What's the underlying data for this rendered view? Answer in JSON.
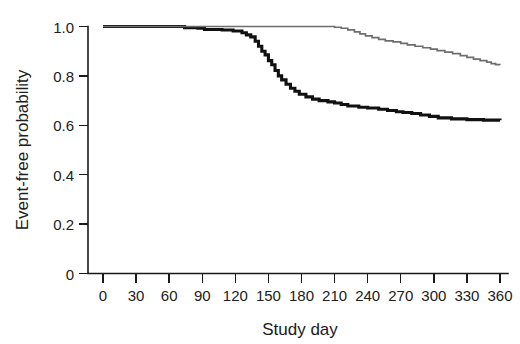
{
  "figure": {
    "background_color": "#ffffff",
    "width": 520,
    "height": 344
  },
  "axes": {
    "x_title": "Study day",
    "y_title": "Event-free probability",
    "x_ticks": [
      "0",
      "30",
      "60",
      "90",
      "120",
      "150",
      "180",
      "210",
      "240",
      "270",
      "300",
      "330",
      "360"
    ],
    "y_ticks": [
      "0",
      "0.2",
      "0.4",
      "0.6",
      "0.8",
      "1.0"
    ]
  },
  "chart_data": {
    "type": "line",
    "title": "",
    "subtitle": "",
    "xlabel": "Study day",
    "ylabel": "Event-free probability",
    "xlim": [
      0,
      360
    ],
    "ylim": [
      0,
      1.0
    ],
    "x_ticks": [
      0,
      30,
      60,
      90,
      120,
      150,
      180,
      210,
      240,
      270,
      300,
      330,
      360
    ],
    "y_ticks": [
      0,
      0.2,
      0.4,
      0.6,
      0.8,
      1.0
    ],
    "grid": false,
    "legend": "none",
    "step_style": "post",
    "annotations": [],
    "series": [
      {
        "name": "black-curve",
        "color": "#111111",
        "line_width": 3.1,
        "final_value": 0.62,
        "points": [
          [
            0,
            1.0
          ],
          [
            70,
            1.0
          ],
          [
            74,
            0.995
          ],
          [
            86,
            0.993
          ],
          [
            92,
            0.988
          ],
          [
            108,
            0.986
          ],
          [
            118,
            0.982
          ],
          [
            126,
            0.975
          ],
          [
            130,
            0.966
          ],
          [
            134,
            0.958
          ],
          [
            138,
            0.94
          ],
          [
            141,
            0.92
          ],
          [
            144,
            0.9
          ],
          [
            147,
            0.885
          ],
          [
            150,
            0.862
          ],
          [
            153,
            0.845
          ],
          [
            156,
            0.822
          ],
          [
            159,
            0.8
          ],
          [
            162,
            0.784
          ],
          [
            166,
            0.766
          ],
          [
            170,
            0.75
          ],
          [
            174,
            0.738
          ],
          [
            178,
            0.726
          ],
          [
            184,
            0.715
          ],
          [
            190,
            0.706
          ],
          [
            196,
            0.7
          ],
          [
            204,
            0.695
          ],
          [
            210,
            0.69
          ],
          [
            216,
            0.684
          ],
          [
            222,
            0.678
          ],
          [
            232,
            0.673
          ],
          [
            240,
            0.67
          ],
          [
            250,
            0.665
          ],
          [
            258,
            0.66
          ],
          [
            266,
            0.655
          ],
          [
            272,
            0.652
          ],
          [
            280,
            0.648
          ],
          [
            288,
            0.642
          ],
          [
            296,
            0.636
          ],
          [
            304,
            0.63
          ],
          [
            316,
            0.626
          ],
          [
            330,
            0.623
          ],
          [
            345,
            0.621
          ],
          [
            360,
            0.62
          ]
        ]
      },
      {
        "name": "gray-curve",
        "color": "#6e6e6e",
        "line_width": 1.7,
        "final_value": 0.845,
        "points": [
          [
            0,
            1.0
          ],
          [
            205,
            1.0
          ],
          [
            210,
            0.997
          ],
          [
            216,
            0.993
          ],
          [
            222,
            0.986
          ],
          [
            228,
            0.978
          ],
          [
            233,
            0.97
          ],
          [
            238,
            0.962
          ],
          [
            244,
            0.955
          ],
          [
            250,
            0.948
          ],
          [
            256,
            0.942
          ],
          [
            263,
            0.938
          ],
          [
            270,
            0.932
          ],
          [
            276,
            0.926
          ],
          [
            283,
            0.92
          ],
          [
            290,
            0.914
          ],
          [
            297,
            0.908
          ],
          [
            303,
            0.902
          ],
          [
            310,
            0.896
          ],
          [
            317,
            0.89
          ],
          [
            324,
            0.882
          ],
          [
            330,
            0.875
          ],
          [
            336,
            0.868
          ],
          [
            342,
            0.862
          ],
          [
            348,
            0.856
          ],
          [
            352,
            0.85
          ],
          [
            356,
            0.846
          ],
          [
            360,
            0.845
          ]
        ]
      }
    ]
  }
}
